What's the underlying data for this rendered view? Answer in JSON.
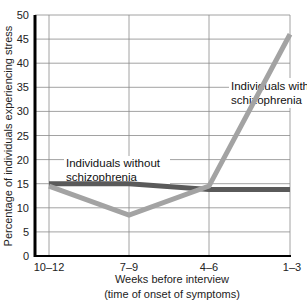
{
  "chart_data": {
    "type": "line",
    "title": "",
    "xlabel": "Weeks before interview",
    "xlabel_line2": "(time of onset of symptoms)",
    "ylabel": "Percentage of individuals experiencing stress",
    "categories": [
      "10–12",
      "7–9",
      "4–6",
      "1–3"
    ],
    "ylim": [
      0,
      50
    ],
    "yticks": [
      0,
      5,
      10,
      15,
      20,
      25,
      30,
      35,
      40,
      45,
      50
    ],
    "grid": true,
    "legend_position": "inline annotations",
    "series": [
      {
        "name": "Individuals with schizophrenia",
        "label_line1": "Individuals with",
        "label_line2": "schizophrenia",
        "color": "#a3a3a3",
        "values": [
          14.5,
          8.5,
          14.5,
          46
        ]
      },
      {
        "name": "Individuals without schizophrenia",
        "label_line1": "Individuals without",
        "label_line2": "schizophrenia",
        "color": "#5a5a5a",
        "values": [
          15,
          15,
          13.8,
          13.8
        ]
      }
    ]
  }
}
